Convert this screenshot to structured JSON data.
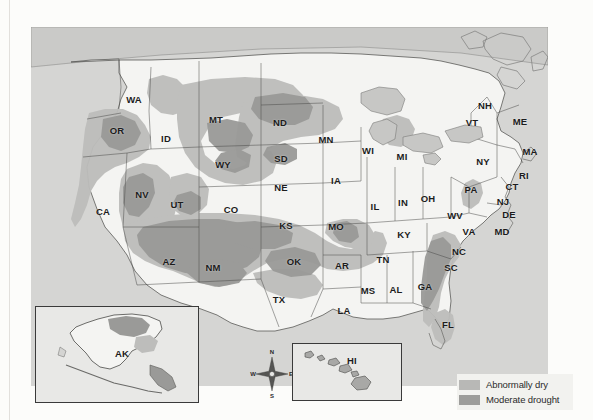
{
  "map": {
    "title": "United States Drought Monitor Map",
    "panel_background": "#d5d5d3",
    "land_fill": "#f4f4f2",
    "water_fill": "#cfcfcd",
    "border_color": "#3d3d3d"
  },
  "legend": {
    "items": [
      {
        "label": "Abnormally dry",
        "color": "#b8b8b6",
        "swatch_name": "abnormally-dry-swatch"
      },
      {
        "label": "Moderate drought",
        "color": "#9d9d9b",
        "swatch_name": "moderate-drought-swatch"
      }
    ]
  },
  "compass": {
    "north": "N",
    "south": "S",
    "east": "E",
    "west": "W"
  },
  "insets": [
    {
      "id": "ak",
      "label": "AK"
    },
    {
      "id": "hi",
      "label": "HI"
    }
  ],
  "states": [
    {
      "abbr": "WA",
      "x": 103,
      "y": 72
    },
    {
      "abbr": "OR",
      "x": 86,
      "y": 103
    },
    {
      "abbr": "ID",
      "x": 135,
      "y": 111
    },
    {
      "abbr": "MT",
      "x": 185,
      "y": 92
    },
    {
      "abbr": "ND",
      "x": 249,
      "y": 95
    },
    {
      "abbr": "MN",
      "x": 295,
      "y": 112
    },
    {
      "abbr": "WI",
      "x": 337,
      "y": 123
    },
    {
      "abbr": "MI",
      "x": 371,
      "y": 129
    },
    {
      "abbr": "WY",
      "x": 192,
      "y": 137
    },
    {
      "abbr": "SD",
      "x": 250,
      "y": 131
    },
    {
      "abbr": "NE",
      "x": 250,
      "y": 160
    },
    {
      "abbr": "IA",
      "x": 305,
      "y": 153
    },
    {
      "abbr": "NV",
      "x": 111,
      "y": 167
    },
    {
      "abbr": "UT",
      "x": 146,
      "y": 177
    },
    {
      "abbr": "CO",
      "x": 200,
      "y": 182
    },
    {
      "abbr": "CA",
      "x": 72,
      "y": 184
    },
    {
      "abbr": "KS",
      "x": 255,
      "y": 198
    },
    {
      "abbr": "MO",
      "x": 305,
      "y": 199
    },
    {
      "abbr": "IL",
      "x": 344,
      "y": 179
    },
    {
      "abbr": "IN",
      "x": 372,
      "y": 175
    },
    {
      "abbr": "OH",
      "x": 397,
      "y": 171
    },
    {
      "abbr": "AZ",
      "x": 138,
      "y": 234
    },
    {
      "abbr": "NM",
      "x": 182,
      "y": 240
    },
    {
      "abbr": "OK",
      "x": 263,
      "y": 234
    },
    {
      "abbr": "AR",
      "x": 311,
      "y": 238
    },
    {
      "abbr": "TN",
      "x": 352,
      "y": 232
    },
    {
      "abbr": "KY",
      "x": 373,
      "y": 207
    },
    {
      "abbr": "TX",
      "x": 248,
      "y": 272
    },
    {
      "abbr": "MS",
      "x": 337,
      "y": 263
    },
    {
      "abbr": "AL",
      "x": 365,
      "y": 262
    },
    {
      "abbr": "GA",
      "x": 394,
      "y": 259
    },
    {
      "abbr": "LA",
      "x": 313,
      "y": 283
    },
    {
      "abbr": "FL",
      "x": 417,
      "y": 297
    },
    {
      "abbr": "SC",
      "x": 420,
      "y": 240
    },
    {
      "abbr": "NC",
      "x": 428,
      "y": 224
    },
    {
      "abbr": "VA",
      "x": 438,
      "y": 204
    },
    {
      "abbr": "WV",
      "x": 424,
      "y": 188
    },
    {
      "abbr": "MD",
      "x": 471,
      "y": 204
    },
    {
      "abbr": "DE",
      "x": 478,
      "y": 187
    },
    {
      "abbr": "NJ",
      "x": 472,
      "y": 174
    },
    {
      "abbr": "PA",
      "x": 440,
      "y": 162
    },
    {
      "abbr": "NY",
      "x": 452,
      "y": 134
    },
    {
      "abbr": "CT",
      "x": 481,
      "y": 159
    },
    {
      "abbr": "RI",
      "x": 493,
      "y": 148
    },
    {
      "abbr": "MA",
      "x": 499,
      "y": 124
    },
    {
      "abbr": "VT",
      "x": 441,
      "y": 95
    },
    {
      "abbr": "NH",
      "x": 454,
      "y": 78
    },
    {
      "abbr": "ME",
      "x": 489,
      "y": 94
    }
  ],
  "chart_data": {
    "type": "map",
    "categories": [
      "Abnormally dry",
      "Moderate drought"
    ],
    "regions": [
      {
        "state": "WA",
        "condition": "none"
      },
      {
        "state": "OR",
        "condition": "abnormally dry"
      },
      {
        "state": "ID",
        "condition": "abnormally dry"
      },
      {
        "state": "MT",
        "condition": "abnormally dry"
      },
      {
        "state": "WY",
        "condition": "abnormally dry"
      },
      {
        "state": "NV",
        "condition": "abnormally dry"
      },
      {
        "state": "UT",
        "condition": "abnormally dry"
      },
      {
        "state": "CA",
        "condition": "abnormally dry"
      },
      {
        "state": "AZ",
        "condition": "moderate drought"
      },
      {
        "state": "NM",
        "condition": "moderate drought"
      },
      {
        "state": "CO",
        "condition": "abnormally dry"
      },
      {
        "state": "ND",
        "condition": "moderate drought"
      },
      {
        "state": "SD",
        "condition": "abnormally dry"
      },
      {
        "state": "NE",
        "condition": "none"
      },
      {
        "state": "KS",
        "condition": "abnormally dry"
      },
      {
        "state": "OK",
        "condition": "abnormally dry"
      },
      {
        "state": "TX",
        "condition": "abnormally dry"
      },
      {
        "state": "MO",
        "condition": "abnormally dry"
      },
      {
        "state": "GA",
        "condition": "moderate drought"
      },
      {
        "state": "SC",
        "condition": "moderate drought"
      },
      {
        "state": "NC",
        "condition": "abnormally dry"
      },
      {
        "state": "FL",
        "condition": "abnormally dry"
      },
      {
        "state": "PA",
        "condition": "abnormally dry"
      },
      {
        "state": "WV",
        "condition": "abnormally dry"
      },
      {
        "state": "AK",
        "condition": "abnormally dry"
      },
      {
        "state": "HI",
        "condition": "none"
      }
    ]
  }
}
